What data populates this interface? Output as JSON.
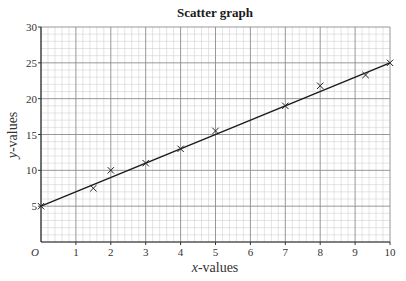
{
  "chart_data": {
    "type": "scatter",
    "title": "Scatter graph",
    "xlabel_italic": "x",
    "xlabel_rest": "-values",
    "ylabel_italic": "y",
    "ylabel_rest": "-values",
    "xlabel": "x-values",
    "ylabel": "y-values",
    "origin_label": "O",
    "xlim": [
      0,
      10
    ],
    "ylim": [
      0,
      30
    ],
    "x_ticks": [
      1,
      2,
      3,
      4,
      5,
      6,
      7,
      8,
      9,
      10
    ],
    "y_ticks": [
      5,
      10,
      15,
      20,
      25,
      30
    ],
    "grid": true,
    "minor_grid_per_unit_x": 5,
    "minor_grid_per_unit_y": 5,
    "marker": "x",
    "points": [
      {
        "x": 0,
        "y": 5
      },
      {
        "x": 1.5,
        "y": 7.5
      },
      {
        "x": 2,
        "y": 10
      },
      {
        "x": 3,
        "y": 11
      },
      {
        "x": 4,
        "y": 13
      },
      {
        "x": 5,
        "y": 15.5
      },
      {
        "x": 7,
        "y": 19
      },
      {
        "x": 8,
        "y": 21.8
      },
      {
        "x": 9.3,
        "y": 23.3
      },
      {
        "x": 10,
        "y": 25
      }
    ],
    "line_of_best_fit": {
      "x1": 0,
      "y1": 5,
      "x2": 10,
      "y2": 25
    },
    "legend": null
  },
  "colors": {
    "major_grid": "#8c8c8c",
    "minor_grid": "#c8c8c8",
    "axis": "#333333",
    "marker": "#222222",
    "line": "#1a1a1a"
  }
}
